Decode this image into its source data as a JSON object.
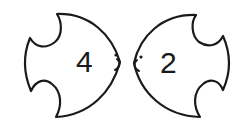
{
  "figure": {
    "fish": [
      {
        "id": "left",
        "facing": "right",
        "number": "4"
      },
      {
        "id": "right",
        "facing": "left",
        "number": "2"
      }
    ],
    "colors": {
      "stroke": "#1a1a1a",
      "fill": "#ffffff",
      "background": "#ffffff"
    }
  }
}
